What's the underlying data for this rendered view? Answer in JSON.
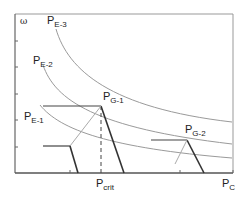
{
  "diagram": {
    "y_axis_label": "ω",
    "x_axis_label": {
      "main": "P",
      "sub": "C"
    },
    "critical_label": {
      "main": "P",
      "sub": "crit"
    },
    "curves": [
      {
        "main": "P",
        "sub": "E-3"
      },
      {
        "main": "P",
        "sub": "E-2"
      },
      {
        "main": "P",
        "sub": "E-1"
      }
    ],
    "points": [
      {
        "main": "P",
        "sub": "G-1"
      },
      {
        "main": "P",
        "sub": "G-2"
      }
    ],
    "colors": {
      "curve": "#9a9a9a",
      "frame": "#8a8a8a",
      "thick_line": "#444444",
      "connector": "#aaaaaa"
    }
  }
}
